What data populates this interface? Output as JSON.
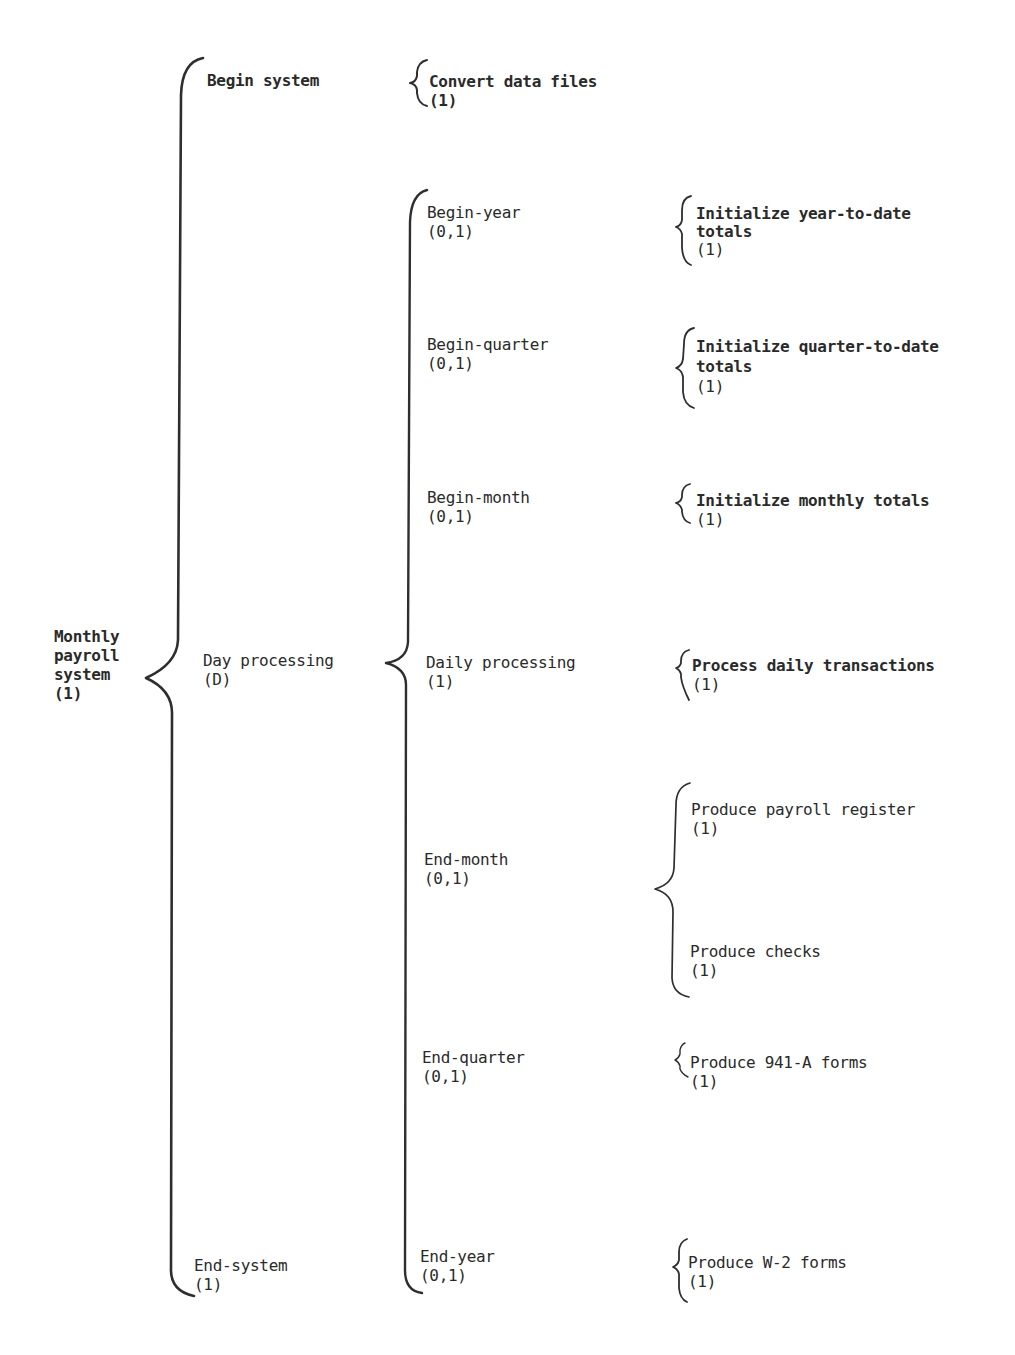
{
  "diagram": {
    "type": "Warnier-Orr diagram",
    "root": {
      "label_lines": [
        "Monthly",
        "payroll",
        "system"
      ],
      "repetition": "(1)"
    },
    "level1": [
      {
        "label": "Begin system",
        "repetition": ""
      },
      {
        "label": "Day processing",
        "repetition": "(D)"
      },
      {
        "label": "End-system",
        "repetition": "(1)"
      }
    ],
    "level2": {
      "begin_system": [
        {
          "label": "Convert data files",
          "repetition": "(1)"
        }
      ],
      "day_processing": [
        {
          "label": "Begin-year",
          "repetition": "(0,1)"
        },
        {
          "label": "Begin-quarter",
          "repetition": "(0,1)"
        },
        {
          "label": "Begin-month",
          "repetition": "(0,1)"
        },
        {
          "label": "Daily processing",
          "repetition": "(1)"
        },
        {
          "label": "End-month",
          "repetition": "(0,1)"
        },
        {
          "label": "End-quarter",
          "repetition": "(0,1)"
        },
        {
          "label": "End-year",
          "repetition": "(0,1)"
        }
      ]
    },
    "level3": {
      "begin_year": {
        "label_lines": [
          "Initialize year-to-date",
          "totals"
        ],
        "repetition": "(1)"
      },
      "begin_quarter": {
        "label_lines": [
          "Initialize quarter-to-date",
          "totals"
        ],
        "repetition": "(1)"
      },
      "begin_month": {
        "label": "Initialize monthly totals",
        "repetition": "(1)"
      },
      "daily_processing": {
        "label": "Process daily transactions",
        "repetition": "(1)"
      },
      "end_month": [
        {
          "label": "Produce payroll register",
          "repetition": "(1)"
        },
        {
          "label": "Produce checks",
          "repetition": "(1)"
        }
      ],
      "end_quarter": {
        "label": "Produce 941-A forms",
        "repetition": "(1)"
      },
      "end_year": {
        "label": "Produce W-2 forms",
        "repetition": "(1)"
      }
    }
  }
}
